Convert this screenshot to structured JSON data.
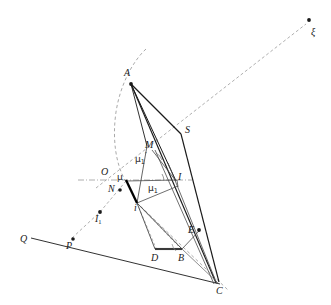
{
  "figure": {
    "kind": "geometric-construction-diagram",
    "width": 331,
    "height": 305,
    "background_color": "#ffffff",
    "ink_color": "#1a1a1a",
    "thin_line_color": "#4a4a4a",
    "dashed_line_color": "#8a8a8a"
  },
  "labels": {
    "xi": "ξ",
    "A": "A",
    "S": "S",
    "M": "M",
    "mu_1_prime": "μ",
    "mu_1_prime_sub": "1",
    "mu_1_prime_sup": "′",
    "O": "O",
    "mu": "μ",
    "I": "I",
    "N": "N",
    "mu_1": "μ",
    "mu_1_sub": "1",
    "i": "i",
    "I_1": "I",
    "I_1_sub": "1",
    "Q": "Q",
    "P": "P",
    "D": "D",
    "B": "B",
    "E": "E",
    "C": "C"
  },
  "points": {
    "xi": {
      "x": 309,
      "y": 21,
      "dot": true
    },
    "A": {
      "x": 131,
      "y": 83,
      "dot": true
    },
    "S": {
      "x": 180,
      "y": 134,
      "dot": false
    },
    "M": {
      "x": 152,
      "y": 153,
      "dot": false
    },
    "O": {
      "x": 110,
      "y": 178,
      "dot": false
    },
    "mu": {
      "x": 126,
      "y": 180,
      "dot": false
    },
    "I": {
      "x": 176,
      "y": 180,
      "dot": false
    },
    "N": {
      "x": 120,
      "y": 190,
      "dot": true
    },
    "mu_1": {
      "x": 155,
      "y": 184,
      "dot": false
    },
    "i": {
      "x": 137,
      "y": 202,
      "dot": false
    },
    "I_1": {
      "x": 100,
      "y": 212,
      "dot": true
    },
    "Q": {
      "x": 28,
      "y": 240,
      "dot": false
    },
    "P": {
      "x": 73,
      "y": 240,
      "dot": true
    },
    "D": {
      "x": 155,
      "y": 250,
      "dot": false
    },
    "B": {
      "x": 182,
      "y": 250,
      "dot": false
    },
    "E": {
      "x": 199,
      "y": 230,
      "dot": true
    },
    "C": {
      "x": 219,
      "y": 283,
      "dot": false
    }
  },
  "label_positions": {
    "xi": {
      "x": 311,
      "y": 27
    },
    "A": {
      "x": 124,
      "y": 68
    },
    "S": {
      "x": 185,
      "y": 125
    },
    "M": {
      "x": 145,
      "y": 140
    },
    "mu_1_prime": {
      "x": 135,
      "y": 155
    },
    "O": {
      "x": 101,
      "y": 167
    },
    "mu": {
      "x": 117,
      "y": 174
    },
    "I": {
      "x": 177,
      "y": 173
    },
    "N": {
      "x": 108,
      "y": 185
    },
    "mu_1": {
      "x": 148,
      "y": 184
    },
    "i": {
      "x": 134,
      "y": 197
    },
    "I_1": {
      "x": 95,
      "y": 214
    },
    "Q": {
      "x": 22,
      "y": 234
    },
    "P": {
      "x": 67,
      "y": 241
    },
    "D": {
      "x": 152,
      "y": 252
    },
    "B": {
      "x": 179,
      "y": 253
    },
    "E": {
      "x": 188,
      "y": 226
    },
    "C": {
      "x": 217,
      "y": 285
    }
  },
  "segments": {
    "solid_thin": [
      {
        "name": "A-S",
        "from": "A",
        "to": "S"
      },
      {
        "name": "A-C-long",
        "from": "A",
        "to": "C"
      },
      {
        "name": "A-I",
        "from": "A",
        "to": "I"
      },
      {
        "name": "A-i",
        "from": "A",
        "to": "i"
      },
      {
        "name": "S-C",
        "from": "S",
        "to": "C"
      },
      {
        "name": "Q-I1-C-ray",
        "from": "Q",
        "to": "C"
      },
      {
        "name": "mu-I",
        "from": "mu",
        "to": "I"
      },
      {
        "name": "i-mu1",
        "from": "i",
        "to": "mu_1"
      },
      {
        "name": "i-D",
        "from": "i",
        "to": "D"
      },
      {
        "name": "i-B",
        "from": "i",
        "to": "B"
      },
      {
        "name": "D-B",
        "from": "D",
        "to": "B"
      },
      {
        "name": "B-E",
        "from": "B",
        "to": "E"
      },
      {
        "name": "M-I",
        "from": "M",
        "to": "I"
      },
      {
        "name": "B-C",
        "from": "B",
        "to": "C"
      }
    ],
    "thick": [
      {
        "name": "mu-i-thick",
        "from": "mu",
        "to": "i"
      },
      {
        "name": "D-B-thick",
        "from": "D",
        "to": "B"
      }
    ],
    "dashed": [
      {
        "name": "O-xi-axis",
        "from": "O",
        "to": "xi"
      },
      {
        "name": "P-A-arc-chord",
        "from": "P",
        "to": "A"
      },
      {
        "name": "i-C-dashed",
        "from": "i",
        "to": "C"
      },
      {
        "name": "O-I-axis-horizontal",
        "from": "O",
        "to": "I"
      }
    ],
    "arcs": [
      {
        "name": "arc-A-center-C",
        "note": "dashed circular arc through A from top to mu"
      }
    ]
  },
  "angle_marks": [
    {
      "name": "angle-at-I",
      "vertex": "I"
    },
    {
      "name": "angle-at-M",
      "vertex": "M"
    },
    {
      "name": "angle-at-B",
      "vertex": "B"
    }
  ]
}
